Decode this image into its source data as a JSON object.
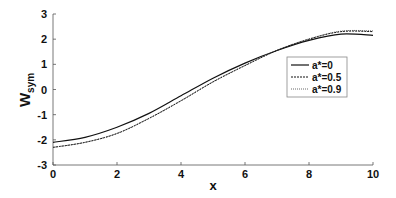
{
  "chart_data": {
    "type": "line",
    "title": "",
    "xlabel": "x",
    "ylabel": "W",
    "ylabel_subscript": "sym",
    "xlim": [
      0,
      10
    ],
    "ylim": [
      -3,
      3
    ],
    "xticks": [
      0,
      2,
      4,
      6,
      8,
      10
    ],
    "yticks": [
      -3,
      -2,
      -1,
      0,
      1,
      2,
      3
    ],
    "grid": false,
    "legend_position": "inside-right",
    "x": [
      0,
      1,
      2,
      3,
      4,
      5,
      6,
      7,
      8,
      9,
      10
    ],
    "series": [
      {
        "name": "a*=0",
        "style": "solid",
        "values": [
          -2.1,
          -1.9,
          -1.5,
          -0.95,
          -0.25,
          0.45,
          1.05,
          1.55,
          1.95,
          2.2,
          2.15
        ]
      },
      {
        "name": "a*=0.5",
        "style": "dashed",
        "values": [
          -2.3,
          -2.1,
          -1.75,
          -1.15,
          -0.45,
          0.3,
          0.95,
          1.55,
          2.0,
          2.3,
          2.3
        ]
      },
      {
        "name": "a*=0.9",
        "style": "dotted",
        "values": [
          -2.3,
          -2.1,
          -1.74,
          -1.14,
          -0.44,
          0.31,
          0.96,
          1.56,
          2.01,
          2.32,
          2.33
        ]
      }
    ]
  },
  "legend": {
    "items": [
      "a*=0",
      "a*=0.5",
      "a*=0.9"
    ]
  }
}
